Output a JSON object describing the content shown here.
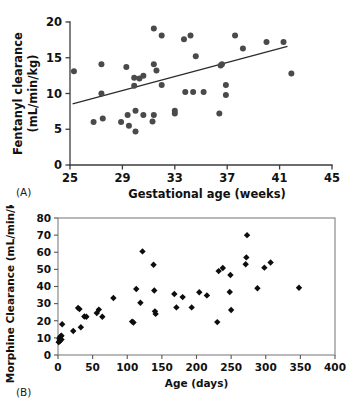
{
  "figure": {
    "panel_a_tag": "(A)",
    "panel_b_tag": "(B)"
  },
  "chart_data": [
    {
      "id": "panel_a",
      "type": "scatter",
      "title": "",
      "xlabel": "Gestational age  (weeks)",
      "ylabel": "Fentanyl clearance\n(mL/min/kg)",
      "ylabel_line1": "Fentanyl clearance",
      "ylabel_line2": "(mL/min/kg)",
      "xlim": [
        25,
        45
      ],
      "ylim": [
        0,
        20
      ],
      "xticks": [
        25,
        29,
        33,
        37,
        41,
        45
      ],
      "yticks": [
        0,
        5,
        10,
        15,
        20
      ],
      "xtick_labels": [
        "25",
        "29",
        "33",
        "37",
        "41",
        "45"
      ],
      "ytick_labels": [
        "0",
        "5",
        "10",
        "15",
        "20"
      ],
      "grid": false,
      "legend": "none",
      "marker": "circle",
      "marker_color": "#4a4a4a",
      "points": [
        [
          25.3,
          13.1
        ],
        [
          26.8,
          6.0
        ],
        [
          27.4,
          14.1
        ],
        [
          27.4,
          10.0
        ],
        [
          27.5,
          6.5
        ],
        [
          28.9,
          6.0
        ],
        [
          29.3,
          13.7
        ],
        [
          29.4,
          7.0
        ],
        [
          29.5,
          5.5
        ],
        [
          29.9,
          12.2
        ],
        [
          29.9,
          11.1
        ],
        [
          30.0,
          7.6
        ],
        [
          30.0,
          4.7
        ],
        [
          30.3,
          12.1
        ],
        [
          30.6,
          12.5
        ],
        [
          30.6,
          7.0
        ],
        [
          31.3,
          6.1
        ],
        [
          31.4,
          19.1
        ],
        [
          31.4,
          14.1
        ],
        [
          31.4,
          7.0
        ],
        [
          31.6,
          13.2
        ],
        [
          32.0,
          18.1
        ],
        [
          32.0,
          11.2
        ],
        [
          33.0,
          7.6
        ],
        [
          33.0,
          7.2
        ],
        [
          33.7,
          17.6
        ],
        [
          33.8,
          10.2
        ],
        [
          34.2,
          18.1
        ],
        [
          34.4,
          10.2
        ],
        [
          34.6,
          15.2
        ],
        [
          35.2,
          10.2
        ],
        [
          36.4,
          7.2
        ],
        [
          36.5,
          13.9
        ],
        [
          36.6,
          14.1
        ],
        [
          36.9,
          11.2
        ],
        [
          36.9,
          9.8
        ],
        [
          37.6,
          18.1
        ],
        [
          38.2,
          16.3
        ],
        [
          40.0,
          17.2
        ],
        [
          41.3,
          17.2
        ],
        [
          41.9,
          12.8
        ]
      ],
      "trend_line": {
        "x": [
          25.2,
          41.6
        ],
        "y": [
          8.55,
          16.6
        ]
      }
    },
    {
      "id": "panel_b",
      "type": "scatter",
      "title": "",
      "xlabel": "Age (days)",
      "ylabel": "Morphine Clearance (mL/min/kg)",
      "xlim": [
        0,
        400
      ],
      "ylim": [
        0,
        80
      ],
      "xticks": [
        0,
        50,
        100,
        150,
        200,
        250,
        300,
        350,
        400
      ],
      "yticks": [
        0,
        10,
        20,
        30,
        40,
        50,
        60,
        70,
        80
      ],
      "xtick_labels": [
        "0",
        "50",
        "100",
        "150",
        "200",
        "250",
        "300",
        "350",
        "400"
      ],
      "ytick_labels": [
        "0",
        "10",
        "20",
        "30",
        "40",
        "50",
        "60",
        "70",
        "80"
      ],
      "grid": false,
      "legend": "none",
      "marker": "diamond",
      "marker_color": "#0d0d0d",
      "points": [
        [
          1,
          7.5
        ],
        [
          2,
          8.0
        ],
        [
          2,
          9.5
        ],
        [
          3,
          10.5
        ],
        [
          3,
          8.5
        ],
        [
          4,
          11.0
        ],
        [
          5,
          11.3
        ],
        [
          5,
          9.0
        ],
        [
          6,
          18.0
        ],
        [
          22,
          14.0
        ],
        [
          29,
          27.5
        ],
        [
          31,
          26.8
        ],
        [
          33,
          16.2
        ],
        [
          38,
          22.5
        ],
        [
          41,
          22.3
        ],
        [
          56,
          24.5
        ],
        [
          59,
          26.5
        ],
        [
          64,
          22.3
        ],
        [
          80,
          33.3
        ],
        [
          107,
          19.5
        ],
        [
          109,
          19.0
        ],
        [
          113,
          38.5
        ],
        [
          119,
          30.5
        ],
        [
          122,
          60.5
        ],
        [
          138,
          52.7
        ],
        [
          139,
          37.7
        ],
        [
          140,
          25.5
        ],
        [
          141,
          24.0
        ],
        [
          168,
          35.6
        ],
        [
          171,
          27.8
        ],
        [
          180,
          33.8
        ],
        [
          193,
          27.8
        ],
        [
          204,
          36.6
        ],
        [
          215,
          34.8
        ],
        [
          230,
          19.2
        ],
        [
          232,
          49.0
        ],
        [
          238,
          50.8
        ],
        [
          248,
          36.8
        ],
        [
          249,
          46.7
        ],
        [
          250,
          26.3
        ],
        [
          271,
          53.0
        ],
        [
          272,
          57.0
        ],
        [
          273,
          70.0
        ],
        [
          288,
          39.0
        ],
        [
          298,
          51.0
        ],
        [
          307,
          54.0
        ],
        [
          348,
          39.3
        ]
      ]
    }
  ]
}
